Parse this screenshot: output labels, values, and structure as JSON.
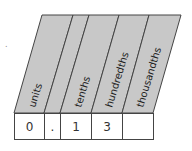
{
  "place_value_chart": {
    "headers": [
      "units",
      "",
      "tenths",
      "hundredths",
      "thousandths"
    ],
    "values": [
      "0",
      ".",
      "1",
      "3",
      ""
    ],
    "header_fill": "#c8c8c8",
    "line_color": "#444444"
  },
  "stray_mark": "."
}
